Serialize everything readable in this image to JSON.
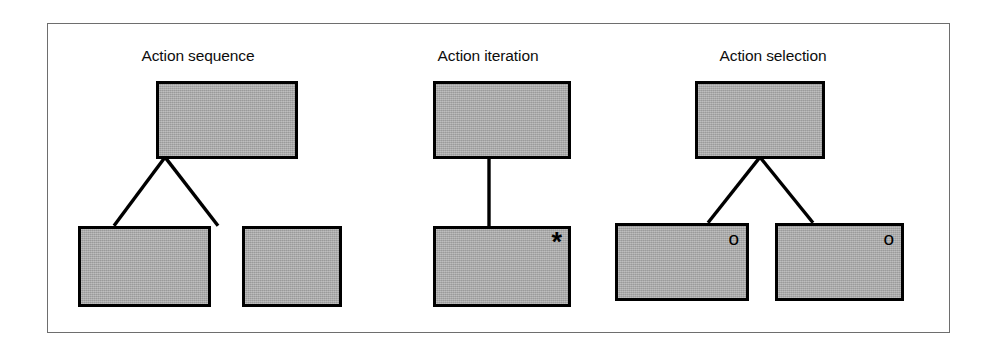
{
  "figure": {
    "frame": {
      "border_color": "#6e6e6e"
    },
    "palette": {
      "node_fill": "#a9a9a9",
      "node_border": "#000000",
      "connector": "#000000",
      "background": "#ffffff",
      "text": "#0d0d0d"
    },
    "panels": [
      {
        "id": "action-sequence",
        "title": "Action sequence",
        "structure": "one parent node with two child nodes joined by two diagonal connectors",
        "parent": {
          "label": "",
          "marker": ""
        },
        "children": [
          {
            "label": "",
            "marker": ""
          },
          {
            "label": "",
            "marker": ""
          }
        ]
      },
      {
        "id": "action-iteration",
        "title": "Action iteration",
        "structure": "one parent node with a single child node joined by one vertical connector",
        "parent": {
          "label": "",
          "marker": ""
        },
        "children": [
          {
            "label": "",
            "marker": "*",
            "marker_name": "iteration-asterisk"
          }
        ]
      },
      {
        "id": "action-selection",
        "title": "Action selection",
        "structure": "one parent node with two child nodes joined by two diagonal connectors",
        "parent": {
          "label": "",
          "marker": ""
        },
        "children": [
          {
            "label": "",
            "marker": "o",
            "marker_name": "optional-circle"
          },
          {
            "label": "",
            "marker": "o",
            "marker_name": "optional-circle"
          }
        ]
      }
    ]
  }
}
